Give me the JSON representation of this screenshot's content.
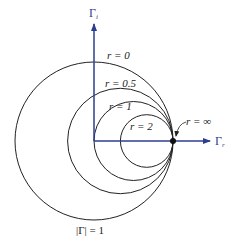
{
  "diagram": {
    "colors": {
      "axis": "#2c3e8f",
      "circle": "#222222",
      "point": "#111111",
      "background": "#ffffff"
    },
    "axes": {
      "vertical": {
        "symbol": "Γ",
        "subscript": "i"
      },
      "horizontal": {
        "symbol": "Γ",
        "subscript": "r"
      }
    },
    "circles": [
      {
        "label": "r = 0",
        "r_value": "0"
      },
      {
        "label": "r = 0.5",
        "r_value": "0.5"
      },
      {
        "label": "r = 1",
        "r_value": "1"
      },
      {
        "label": "r = 2",
        "r_value": "2"
      }
    ],
    "point_label": "r = ∞",
    "boundary_label": "|Γ| = 1"
  }
}
